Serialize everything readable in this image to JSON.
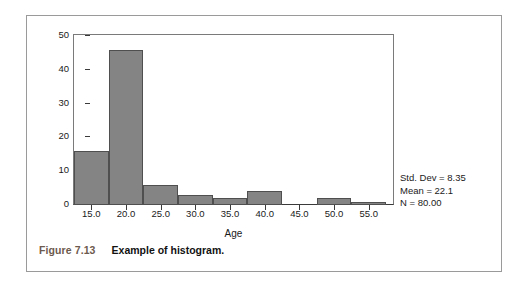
{
  "figure": {
    "caption_number": "Figure 7.13",
    "caption_text": "Example of histogram."
  },
  "stats": {
    "std_dev": "Std. Dev = 8.35",
    "mean": "Mean = 22.1",
    "n": "N = 80.00"
  },
  "colors": {
    "bar_fill": "#848484",
    "bar_edge": "#4f4f4f",
    "axis": "#3a3a3a",
    "frame": "#7a7a7a",
    "caption_number": "#6d5a4e",
    "caption_text": "#111111",
    "box_border": "#9a9a9a"
  },
  "chart_data": {
    "type": "bar",
    "title": "",
    "subtitle": "",
    "xlabel": "Age",
    "ylabel": "",
    "grid": false,
    "legend": "none",
    "bin_width": 5,
    "categories": [
      "12.5-17.5",
      "17.5-22.5",
      "22.5-27.5",
      "27.5-32.5",
      "32.5-37.5",
      "37.5-42.5",
      "42.5-47.5",
      "47.5-52.5",
      "52.5-57.5"
    ],
    "bin_starts": [
      12.5,
      17.5,
      22.5,
      27.5,
      32.5,
      37.5,
      42.5,
      47.5,
      52.5
    ],
    "values": [
      16,
      46,
      6,
      3,
      2,
      4,
      0,
      2,
      1
    ],
    "xlim": [
      12.5,
      58.5
    ],
    "ylim": [
      0,
      50
    ],
    "ytick_labels": [
      "0",
      "10",
      "20",
      "30",
      "40",
      "50"
    ],
    "ytick_values": [
      0,
      10,
      20,
      30,
      40,
      50
    ],
    "xtick_labels": [
      "15.0",
      "20.0",
      "25.0",
      "30.0",
      "35.0",
      "40.0",
      "45.0",
      "50.0",
      "55.0"
    ],
    "xtick_values": [
      15,
      20,
      25,
      30,
      35,
      40,
      45,
      50,
      55
    ],
    "annotations": [
      "Std. Dev = 8.35",
      "Mean = 22.1",
      "N = 80.00"
    ]
  }
}
